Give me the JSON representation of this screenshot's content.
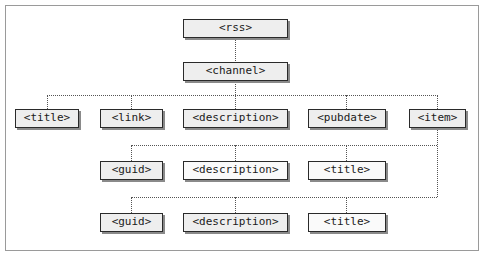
{
  "diagram": {
    "type": "tree",
    "nodes": {
      "rss": "<rss>",
      "channel": "<channel>",
      "channel_children": [
        "<title>",
        "<link>",
        "<description>",
        "<pubdate>",
        "<item>"
      ],
      "item1_children": [
        "<guid>",
        "<description>",
        "<title>"
      ],
      "item2_children": [
        "<guid>",
        "<description>",
        "<title>"
      ]
    },
    "edges": [
      [
        "<rss>",
        "<channel>"
      ],
      [
        "<channel>",
        "<title>"
      ],
      [
        "<channel>",
        "<link>"
      ],
      [
        "<channel>",
        "<description>"
      ],
      [
        "<channel>",
        "<pubdate>"
      ],
      [
        "<channel>",
        "<item>"
      ],
      [
        "<item>",
        "<guid>"
      ],
      [
        "<item>",
        "<description>"
      ],
      [
        "<item>",
        "<title>"
      ]
    ],
    "colors": {
      "border": "#2a2a2a",
      "fill": "#eeeeee",
      "connector": "#555555",
      "frame": "#9a9a9a"
    }
  }
}
